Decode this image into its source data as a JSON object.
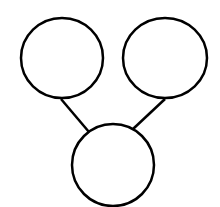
{
  "diagram": {
    "type": "tree",
    "stroke_color": "#000000",
    "background": "#ffffff",
    "nodes": [
      {
        "id": "left",
        "label": "",
        "cx": 62,
        "cy": 58,
        "r": 41
      },
      {
        "id": "right",
        "label": "",
        "cx": 165,
        "cy": 58,
        "r": 41
      },
      {
        "id": "bottom",
        "label": "",
        "cx": 113,
        "cy": 165,
        "r": 41
      }
    ],
    "edges": [
      {
        "from": "left",
        "to": "bottom"
      },
      {
        "from": "right",
        "to": "bottom"
      }
    ]
  }
}
